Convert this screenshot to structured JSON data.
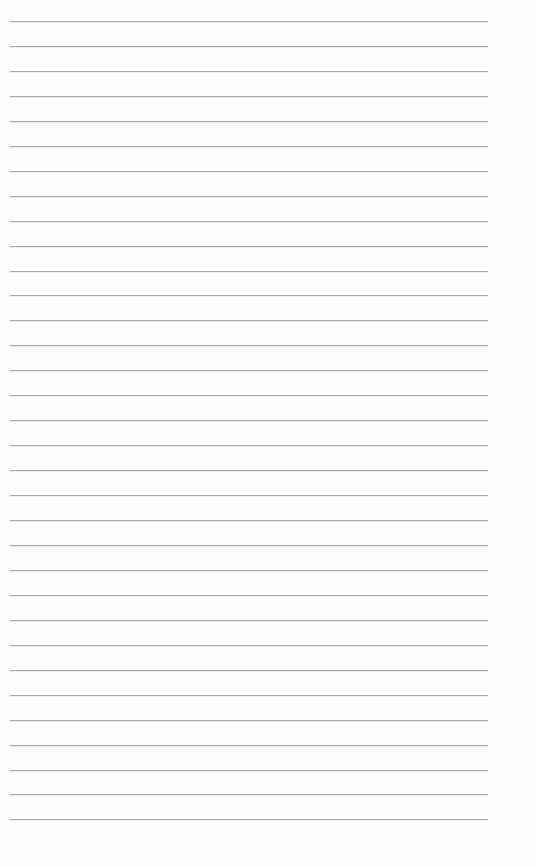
{
  "page": {
    "type": "lined-paper",
    "line_count": 33,
    "first_line_y": 21,
    "line_spacing": 24.95,
    "line_left": 10,
    "line_width": 478,
    "line_color": "#a9a9a9",
    "background": "#fefefe"
  }
}
